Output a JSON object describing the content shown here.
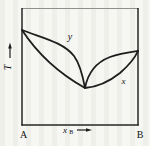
{
  "figure": {
    "type": "temperature-composition-phase-diagram",
    "colors": {
      "line": "#1d1d1d",
      "frame_top": "#8f8f8f",
      "background": "#f6f6f2",
      "text": "#111111"
    },
    "y_axis": {
      "label": "T",
      "arrow_icon": "up-arrow"
    },
    "x_axis": {
      "label_base": "x",
      "label_sub": "B",
      "arrow_icon": "right-arrow"
    },
    "endpoints": {
      "left": "A",
      "right": "B"
    },
    "curves": [
      {
        "name": "vapor",
        "label": "y",
        "path": "M 22 30 C 42 38 63 42 74 56 C 80 64 83 77 85 88 C 88 72 97 62 110 57 C 121 53 131 52 138 51"
      },
      {
        "name": "liquid",
        "label": "x",
        "path": "M 22 30 C 37 53 60 74 85 88 C 97 87 110 81 120 73 C 128 66 134 60 138 51"
      }
    ]
  }
}
